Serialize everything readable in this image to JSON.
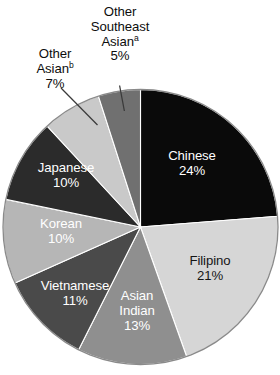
{
  "chart_data": {
    "type": "pie",
    "title": "",
    "subtitle": "",
    "xlabel": "",
    "ylabel": "",
    "grid": false,
    "legend_position": "none",
    "start_angle_deg": 0,
    "direction": "clockwise",
    "unit": "%",
    "categories": [
      "Chinese",
      "Filipino",
      "Asian Indian",
      "Vietnamese",
      "Korean",
      "Japanese",
      "Other Asian",
      "Other Southeast Asian"
    ],
    "values": [
      24,
      21,
      13,
      11,
      10,
      10,
      7,
      5
    ],
    "slices": [
      {
        "name": "Chinese",
        "label_line1": "Chinese",
        "label_line2": "24%",
        "value": 24,
        "value_text": "24%",
        "color": "#0a0a0a",
        "text_color": "#ffffff",
        "label_placement": "inside",
        "footnote_marker": ""
      },
      {
        "name": "Filipino",
        "label_line1": "Filipino",
        "label_line2": "21%",
        "value": 21,
        "value_text": "21%",
        "color": "#d6d6d6",
        "text_color": "#151515",
        "label_placement": "inside",
        "footnote_marker": ""
      },
      {
        "name": "Asian Indian",
        "label_line1": "Asian",
        "label_line2": "Indian",
        "label_line3": "13%",
        "value": 13,
        "value_text": "13%",
        "color": "#8f8f8f",
        "text_color": "#ffffff",
        "label_placement": "inside",
        "footnote_marker": ""
      },
      {
        "name": "Vietnamese",
        "label_line1": "Vietnamese",
        "label_line2": "11%",
        "value": 11,
        "value_text": "11%",
        "color": "#4a4a4a",
        "text_color": "#ffffff",
        "label_placement": "inside",
        "footnote_marker": ""
      },
      {
        "name": "Korean",
        "label_line1": "Korean",
        "label_line2": "10%",
        "value": 10,
        "value_text": "10%",
        "color": "#b6b6b6",
        "text_color": "#ffffff",
        "label_placement": "inside",
        "footnote_marker": ""
      },
      {
        "name": "Japanese",
        "label_line1": "Japanese",
        "label_line2": "10%",
        "value": 10,
        "value_text": "10%",
        "color": "#2b2b2b",
        "text_color": "#ffffff",
        "label_placement": "inside",
        "footnote_marker": ""
      },
      {
        "name": "Other Asian",
        "label_line1": "Other",
        "label_line2": "Asian",
        "label_line3": "7%",
        "value": 7,
        "value_text": "7%",
        "color": "#c9c9c9",
        "text_color": "#0d0d0d",
        "label_placement": "outside-callout",
        "footnote_marker": "b"
      },
      {
        "name": "Other Southeast Asian",
        "label_line1": "Other",
        "label_line2": "Southeast",
        "label_line3": "Asian",
        "label_line4": "5%",
        "value": 5,
        "value_text": "5%",
        "color": "#707070",
        "text_color": "#0d0d0d",
        "label_placement": "outside-callout",
        "footnote_marker": "a"
      }
    ]
  },
  "figure": {
    "outline_color": "#8a8a8a",
    "leader_line_color": "#3a3a3a",
    "background": "#ffffff"
  }
}
